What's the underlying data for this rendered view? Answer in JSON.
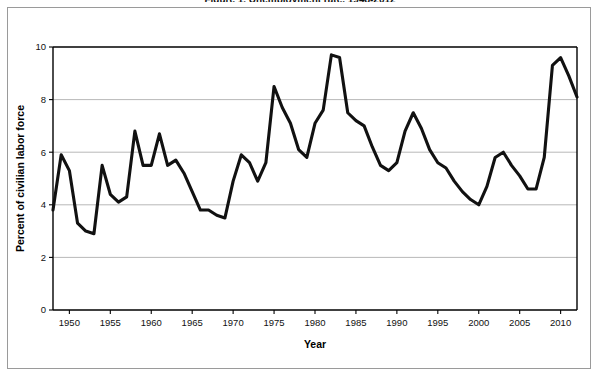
{
  "chart": {
    "title_partial": "Figure 1. Unemployment rate, 1948-2012",
    "xaxis_title": "Year",
    "yaxis_title": "Percent of civilian labor force"
  },
  "chart_data": {
    "type": "line",
    "title": "Figure 1. Unemployment rate, 1948-2012",
    "xlabel": "Year",
    "ylabel": "Percent of civilian labor force",
    "xlim": [
      1948,
      2012
    ],
    "ylim": [
      0,
      10
    ],
    "xticks": [
      1950,
      1955,
      1960,
      1965,
      1970,
      1975,
      1980,
      1985,
      1990,
      1995,
      2000,
      2005,
      2010
    ],
    "yticks": [
      0,
      2,
      4,
      6,
      8,
      10
    ],
    "grid": "horizontal",
    "legend": "none",
    "line_color": "#111111",
    "series": [
      {
        "name": "Unemployment rate",
        "x": [
          1948,
          1949,
          1950,
          1951,
          1952,
          1953,
          1954,
          1955,
          1956,
          1957,
          1958,
          1959,
          1960,
          1961,
          1962,
          1963,
          1964,
          1965,
          1966,
          1967,
          1968,
          1969,
          1970,
          1971,
          1972,
          1973,
          1974,
          1975,
          1976,
          1977,
          1978,
          1979,
          1980,
          1981,
          1982,
          1983,
          1984,
          1985,
          1986,
          1987,
          1988,
          1989,
          1990,
          1991,
          1992,
          1993,
          1994,
          1995,
          1996,
          1997,
          1998,
          1999,
          2000,
          2001,
          2002,
          2003,
          2004,
          2005,
          2006,
          2007,
          2008,
          2009,
          2010,
          2011,
          2012
        ],
        "values": [
          3.8,
          5.9,
          5.3,
          3.3,
          3.0,
          2.9,
          5.5,
          4.4,
          4.1,
          4.3,
          6.8,
          5.5,
          5.5,
          6.7,
          5.5,
          5.7,
          5.2,
          4.5,
          3.8,
          3.8,
          3.6,
          3.5,
          4.9,
          5.9,
          5.6,
          4.9,
          5.6,
          8.5,
          7.7,
          7.1,
          6.1,
          5.8,
          7.1,
          7.6,
          9.7,
          9.6,
          7.5,
          7.2,
          7.0,
          6.2,
          5.5,
          5.3,
          5.6,
          6.8,
          7.5,
          6.9,
          6.1,
          5.6,
          5.4,
          4.9,
          4.5,
          4.2,
          4.0,
          4.7,
          5.8,
          6.0,
          5.5,
          5.1,
          4.6,
          4.6,
          5.8,
          9.3,
          9.6,
          8.9,
          8.1
        ]
      }
    ]
  }
}
